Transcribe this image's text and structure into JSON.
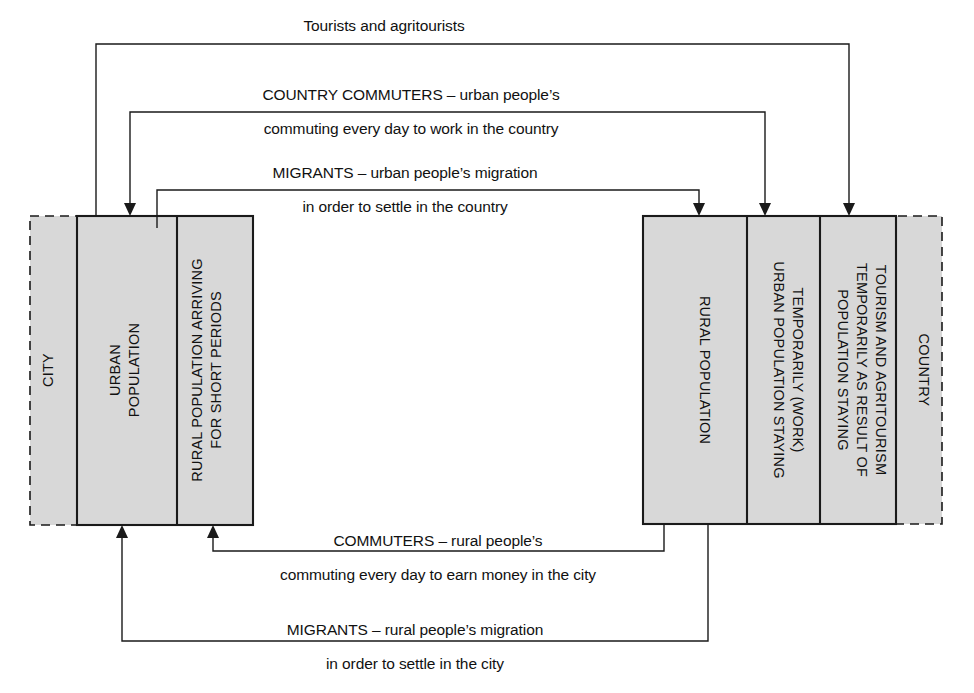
{
  "diagram": {
    "colors": {
      "fill": "#d8d8d8",
      "stroke": "#1a1a1a",
      "background": "#ffffff"
    },
    "zones": {
      "city": {
        "label": "CITY",
        "cells": [
          {
            "label": "URBAN POPULATION"
          },
          {
            "label_line1": "RURAL POPULATION ARRIVING",
            "label_line2": "FOR SHORT PERIODS"
          }
        ]
      },
      "country": {
        "label": "COUNTRY",
        "cells": [
          {
            "label": "RURAL POPULATION"
          },
          {
            "label_line1": "URBAN POPULATION STAYING",
            "label_line2": "TEMPORARILY (WORK)"
          },
          {
            "label_line1": "POPULATION STAYING",
            "label_line2": "TEMPORARILY AS RESULT OF",
            "label_line3": "TOURISM AND AGRITOURISM"
          }
        ]
      }
    },
    "flows": [
      {
        "id": "tourists",
        "direction": "city-to-country",
        "line1": "Tourists and agritourists",
        "line2": ""
      },
      {
        "id": "country-commuters",
        "direction": "city-to-country",
        "line1": "COUNTRY COMMUTERS – urban people’s",
        "line2": "commuting every day to work in the country"
      },
      {
        "id": "urban-migrants",
        "direction": "city-to-country",
        "line1": "MIGRANTS – urban people’s migration",
        "line2": "in order to settle in the country"
      },
      {
        "id": "rural-commuters",
        "direction": "country-to-city",
        "line1": "COMMUTERS – rural people’s",
        "line2": "commuting every day to earn money in the city"
      },
      {
        "id": "rural-migrants",
        "direction": "country-to-city",
        "line1": "MIGRANTS – rural people’s migration",
        "line2": "in order to settle in the city"
      }
    ]
  }
}
